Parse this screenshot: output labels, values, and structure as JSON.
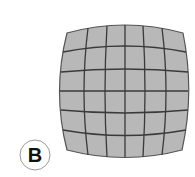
{
  "figure": {
    "label": "B",
    "grid": {
      "rows": 6,
      "cols": 6
    },
    "colors": {
      "fill": "#b8b8b8",
      "line": "#3a3a3a",
      "background": "#ffffff",
      "label_circle": "#9a9a9a",
      "label_text": "#111111"
    }
  }
}
